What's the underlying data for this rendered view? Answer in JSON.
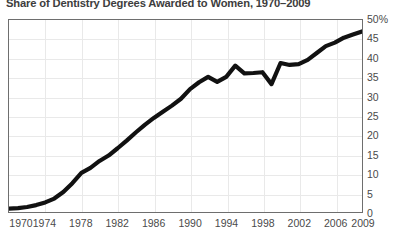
{
  "chart_data": {
    "type": "line",
    "title": "Share of Dentistry Degrees Awarded to Women, 1970–2009",
    "xlabel": "",
    "ylabel": "",
    "xlim": [
      1970,
      2009
    ],
    "ylim": [
      0,
      50
    ],
    "grid": true,
    "legend": null,
    "y_tick_labels": [
      "50%",
      "45",
      "40",
      "35",
      "30",
      "25",
      "20",
      "15",
      "10",
      "5",
      "0"
    ],
    "y_tick_values": [
      50,
      45,
      40,
      35,
      30,
      25,
      20,
      15,
      10,
      5,
      0
    ],
    "x_tick_labels": [
      "1970",
      "1974",
      "1978",
      "1982",
      "1986",
      "1990",
      "1994",
      "1998",
      "2002",
      "2006",
      "2009"
    ],
    "x_tick_values": [
      1970,
      1974,
      1978,
      1982,
      1986,
      1990,
      1994,
      1998,
      2002,
      2006,
      2009
    ],
    "line_color": "#111111",
    "line_width": 4.2,
    "series": [
      {
        "name": "Share of dentistry degrees awarded to women",
        "x": [
          1970,
          1971,
          1972,
          1973,
          1974,
          1975,
          1976,
          1977,
          1978,
          1979,
          1980,
          1981,
          1982,
          1983,
          1984,
          1985,
          1986,
          1987,
          1988,
          1989,
          1990,
          1991,
          1992,
          1993,
          1994,
          1995,
          1996,
          1997,
          1998,
          1999,
          2000,
          2001,
          2002,
          2003,
          2004,
          2005,
          2006,
          2007,
          2008,
          2009
        ],
        "values": [
          0.9,
          1.0,
          1.3,
          1.8,
          2.5,
          3.5,
          5.2,
          7.5,
          10.2,
          11.5,
          13.3,
          14.7,
          16.6,
          18.6,
          20.7,
          22.7,
          24.5,
          26.1,
          27.7,
          29.5,
          32.0,
          33.8,
          35.2,
          33.9,
          35.2,
          38.1,
          36.1,
          36.2,
          36.4,
          33.3,
          38.8,
          38.3,
          38.5,
          39.6,
          41.4,
          43.2,
          44.1,
          45.4,
          46.2,
          47.0
        ]
      }
    ]
  }
}
